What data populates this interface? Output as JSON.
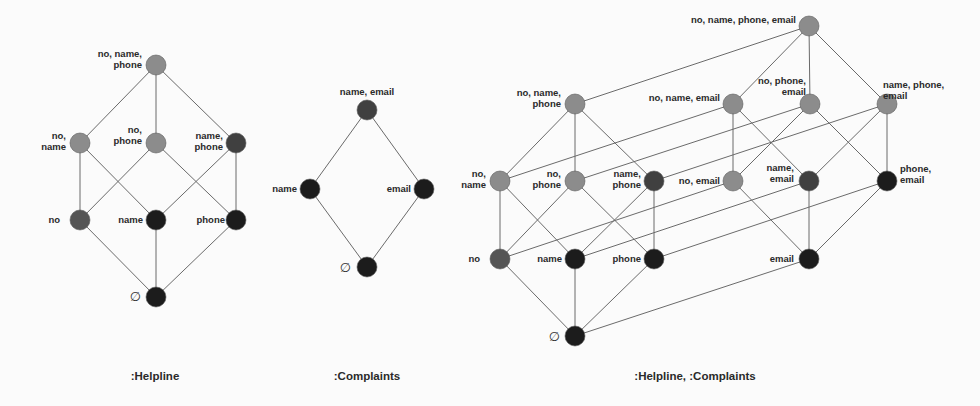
{
  "colors": {
    "light": "#8c8c8c",
    "medium": "#555555",
    "dark": "#404040",
    "black": "#1c1c1c",
    "edge": "#6a6a6a"
  },
  "diagrams": [
    {
      "id": "helpline",
      "caption": ":Helpline",
      "caption_pos": [
        155,
        376
      ],
      "nodes": [
        {
          "id": "no_name_phone",
          "label": [
            "no, name,",
            "phone"
          ],
          "x": 156,
          "y": 65,
          "shade": "light",
          "anchor": "end",
          "lx": -14,
          "ly": -8
        },
        {
          "id": "no_name",
          "label": [
            "no,",
            "name"
          ],
          "x": 80,
          "y": 143,
          "shade": "light",
          "anchor": "end",
          "lx": -14,
          "ly": -4
        },
        {
          "id": "no_phone",
          "label": [
            "no,",
            "phone"
          ],
          "x": 156,
          "y": 143,
          "shade": "light",
          "anchor": "end",
          "lx": -14,
          "ly": -10
        },
        {
          "id": "name_phone",
          "label": [
            "name,",
            "phone"
          ],
          "x": 236,
          "y": 143,
          "shade": "dark",
          "anchor": "end",
          "lx": -13,
          "ly": -4
        },
        {
          "id": "no",
          "label": [
            "no"
          ],
          "x": 80,
          "y": 220,
          "shade": "medium",
          "anchor": "end",
          "lx": -20,
          "ly": 3
        },
        {
          "id": "name",
          "label": [
            "name"
          ],
          "x": 156,
          "y": 220,
          "shade": "black",
          "anchor": "end",
          "lx": -13,
          "ly": 3
        },
        {
          "id": "phone",
          "label": [
            "phone"
          ],
          "x": 236,
          "y": 220,
          "shade": "black",
          "anchor": "end",
          "lx": -11,
          "ly": 3
        },
        {
          "id": "empty",
          "label": [
            "∅"
          ],
          "x": 156,
          "y": 297,
          "shade": "black",
          "anchor": "end",
          "lx": -15,
          "ly": 4,
          "is_empty": true
        }
      ],
      "edges": [
        [
          "no_name_phone",
          "no_name"
        ],
        [
          "no_name_phone",
          "no_phone"
        ],
        [
          "no_name_phone",
          "name_phone"
        ],
        [
          "no_name",
          "no"
        ],
        [
          "no_name",
          "name"
        ],
        [
          "no_phone",
          "no"
        ],
        [
          "no_phone",
          "phone"
        ],
        [
          "name_phone",
          "name"
        ],
        [
          "name_phone",
          "phone"
        ],
        [
          "no",
          "empty"
        ],
        [
          "name",
          "empty"
        ],
        [
          "phone",
          "empty"
        ]
      ]
    },
    {
      "id": "complaints",
      "caption": ":Complaints",
      "caption_pos": [
        367,
        376
      ],
      "nodes": [
        {
          "id": "name_email",
          "label": [
            "name, email"
          ],
          "x": 367,
          "y": 110,
          "shade": "dark",
          "anchor": "middle",
          "lx": 0,
          "ly": -15
        },
        {
          "id": "name",
          "label": [
            "name"
          ],
          "x": 310,
          "y": 189,
          "shade": "black",
          "anchor": "end",
          "lx": -13,
          "ly": 3
        },
        {
          "id": "email",
          "label": [
            "email"
          ],
          "x": 424,
          "y": 189,
          "shade": "black",
          "anchor": "end",
          "lx": -13,
          "ly": 3
        },
        {
          "id": "empty",
          "label": [
            "∅"
          ],
          "x": 367,
          "y": 267,
          "shade": "black",
          "anchor": "end",
          "lx": -16,
          "ly": 5,
          "is_empty": true
        }
      ],
      "edges": [
        [
          "name_email",
          "name"
        ],
        [
          "name_email",
          "email"
        ],
        [
          "name",
          "empty"
        ],
        [
          "email",
          "empty"
        ]
      ]
    },
    {
      "id": "helpline_complaints",
      "caption": ":Helpline, :Complaints",
      "caption_pos": [
        695,
        376
      ],
      "nodes": [
        {
          "id": "no_name_phone_email",
          "label": [
            "no, name, phone, email"
          ],
          "x": 809,
          "y": 26,
          "shade": "light",
          "anchor": "end",
          "lx": -13,
          "ly": -3
        },
        {
          "id": "no_name_phone",
          "label": [
            "no, name,",
            "phone"
          ],
          "x": 575,
          "y": 104,
          "shade": "light",
          "anchor": "end",
          "lx": -14,
          "ly": -8
        },
        {
          "id": "no_name_email",
          "label": [
            "no, name, email"
          ],
          "x": 733,
          "y": 104,
          "shade": "light",
          "anchor": "end",
          "lx": -13,
          "ly": -3
        },
        {
          "id": "no_phone_email",
          "label": [
            "no, phone,",
            "email"
          ],
          "x": 810,
          "y": 104,
          "shade": "light",
          "anchor": "end",
          "lx": -4,
          "ly": -20
        },
        {
          "id": "name_phone_email",
          "label": [
            "name, phone,",
            "email"
          ],
          "x": 887,
          "y": 104,
          "shade": "light",
          "anchor": "start",
          "lx": -4,
          "ly": -16
        },
        {
          "id": "no_name",
          "label": [
            "no,",
            "name"
          ],
          "x": 500,
          "y": 181,
          "shade": "light",
          "anchor": "end",
          "lx": -14,
          "ly": -4
        },
        {
          "id": "no_phone",
          "label": [
            "no,",
            "phone"
          ],
          "x": 575,
          "y": 181,
          "shade": "light",
          "anchor": "end",
          "lx": -14,
          "ly": -4
        },
        {
          "id": "name_phone",
          "label": [
            "name,",
            "phone"
          ],
          "x": 654,
          "y": 181,
          "shade": "dark",
          "anchor": "end",
          "lx": -13,
          "ly": -4
        },
        {
          "id": "no_email",
          "label": [
            "no, email"
          ],
          "x": 733,
          "y": 181,
          "shade": "light",
          "anchor": "end",
          "lx": -13,
          "ly": 3
        },
        {
          "id": "name_email",
          "label": [
            "name,",
            "email"
          ],
          "x": 809,
          "y": 181,
          "shade": "dark",
          "anchor": "end",
          "lx": -15,
          "ly": -10
        },
        {
          "id": "phone_email",
          "label": [
            "phone,",
            "email"
          ],
          "x": 887,
          "y": 181,
          "shade": "black",
          "anchor": "start",
          "lx": 13,
          "ly": -9
        },
        {
          "id": "no",
          "label": [
            "no"
          ],
          "x": 500,
          "y": 259,
          "shade": "medium",
          "anchor": "end",
          "lx": -20,
          "ly": 3
        },
        {
          "id": "name",
          "label": [
            "name"
          ],
          "x": 575,
          "y": 259,
          "shade": "black",
          "anchor": "end",
          "lx": -13,
          "ly": 3
        },
        {
          "id": "phone",
          "label": [
            "phone"
          ],
          "x": 654,
          "y": 259,
          "shade": "black",
          "anchor": "end",
          "lx": -13,
          "ly": 3
        },
        {
          "id": "email",
          "label": [
            "email"
          ],
          "x": 809,
          "y": 259,
          "shade": "black",
          "anchor": "end",
          "lx": -15,
          "ly": 3
        },
        {
          "id": "empty",
          "label": [
            "∅"
          ],
          "x": 575,
          "y": 336,
          "shade": "black",
          "anchor": "end",
          "lx": -15,
          "ly": 5,
          "is_empty": true
        }
      ],
      "edges": [
        [
          "no_name_phone",
          "no_name"
        ],
        [
          "no_name_phone",
          "no_phone"
        ],
        [
          "no_name_phone",
          "name_phone"
        ],
        [
          "no_name",
          "no"
        ],
        [
          "no_name",
          "name"
        ],
        [
          "no_phone",
          "no"
        ],
        [
          "no_phone",
          "phone"
        ],
        [
          "name_phone",
          "name"
        ],
        [
          "name_phone",
          "phone"
        ],
        [
          "no",
          "empty"
        ],
        [
          "name",
          "empty"
        ],
        [
          "phone",
          "empty"
        ],
        [
          "no_name_phone_email",
          "no_name_email"
        ],
        [
          "no_name_phone_email",
          "no_phone_email"
        ],
        [
          "no_name_phone_email",
          "name_phone_email"
        ],
        [
          "no_name_email",
          "no_email"
        ],
        [
          "no_name_email",
          "name_email"
        ],
        [
          "no_phone_email",
          "no_email"
        ],
        [
          "no_phone_email",
          "phone_email"
        ],
        [
          "name_phone_email",
          "name_email"
        ],
        [
          "name_phone_email",
          "phone_email"
        ],
        [
          "no_email",
          "email"
        ],
        [
          "name_email",
          "email"
        ],
        [
          "phone_email",
          "email"
        ],
        [
          "no_name_phone",
          "no_name_phone_email"
        ],
        [
          "no_name",
          "no_name_email"
        ],
        [
          "no_phone",
          "no_phone_email"
        ],
        [
          "name_phone",
          "name_phone_email"
        ],
        [
          "no",
          "no_email"
        ],
        [
          "name",
          "name_email"
        ],
        [
          "phone",
          "phone_email"
        ],
        [
          "empty",
          "email"
        ]
      ]
    }
  ]
}
